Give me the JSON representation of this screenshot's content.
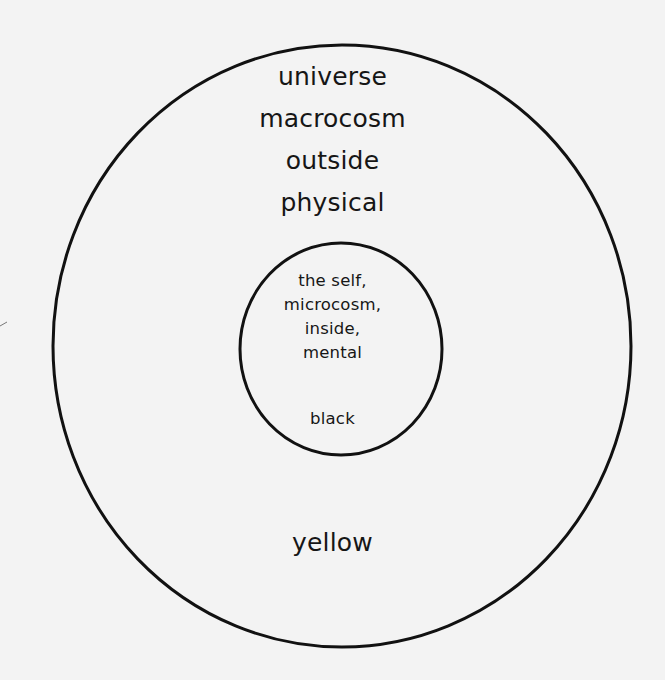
{
  "diagram": {
    "type": "concentric-circles",
    "colors": {
      "background": "#f3f3f3",
      "stroke": "#111111",
      "text": "#161616"
    },
    "outer_circle": {
      "labels": [
        "universe",
        "macrocosm",
        "outside",
        "physical"
      ],
      "color_label": "yellow"
    },
    "inner_circle": {
      "labels": [
        "the self,",
        "microcosm,",
        "inside,",
        "mental"
      ],
      "color_label": "black"
    }
  }
}
